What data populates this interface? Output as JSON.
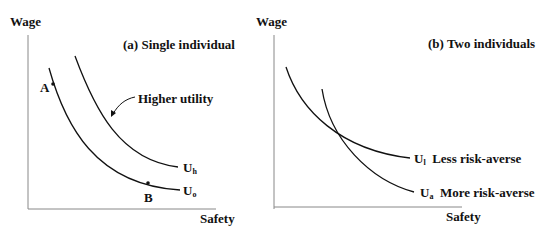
{
  "panel_a": {
    "title": "(a) Single individual",
    "y_axis_label": "Wage",
    "x_axis_label": "Safety",
    "point_a": "A",
    "point_b": "B",
    "annotation": "Higher utility",
    "curves": [
      {
        "base": "U",
        "sub": "h"
      },
      {
        "base": "U",
        "sub": "o"
      }
    ]
  },
  "panel_b": {
    "title": "(b) Two individuals",
    "y_axis_label": "Wage",
    "x_axis_label": "Safety",
    "curves": [
      {
        "base": "U",
        "sub": "l",
        "desc": "Less risk-averse"
      },
      {
        "base": "U",
        "sub": "a",
        "desc": "More risk-averse"
      }
    ]
  }
}
